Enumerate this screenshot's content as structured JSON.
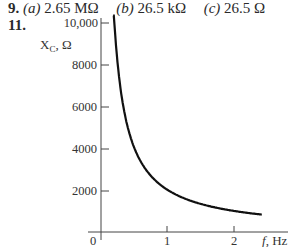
{
  "answers": {
    "problem_9": {
      "number": "9.",
      "parts": [
        {
          "label": "(a)",
          "value": "2.65 MΩ"
        },
        {
          "label": "(b)",
          "value": "26.5 kΩ"
        },
        {
          "label": "(c)",
          "value": "26.5 Ω"
        }
      ]
    },
    "problem_11": {
      "number": "11."
    }
  },
  "chart_data": {
    "type": "line",
    "title": "",
    "xlabel": "f, Hz",
    "ylabel": "X_C, Ω",
    "xlim": [
      0,
      2.5
    ],
    "ylim": [
      0,
      10000
    ],
    "x_ticks": [
      "1",
      "2"
    ],
    "x_origin_label": "0",
    "y_ticks": [
      "2000",
      "4000",
      "6000",
      "8000",
      "10,000"
    ],
    "grid": false,
    "legend": null,
    "series": [
      {
        "name": "X_C vs f",
        "x": [
          0.2,
          0.25,
          0.3,
          0.4,
          0.5,
          0.6,
          0.8,
          1.0,
          1.2,
          1.5,
          1.8,
          2.0,
          2.2,
          2.4
        ],
        "y": [
          9950,
          7960,
          6630,
          4970,
          3980,
          3320,
          2490,
          1990,
          1660,
          1330,
          1110,
          995,
          905,
          830
        ]
      }
    ],
    "color": "#111111"
  }
}
